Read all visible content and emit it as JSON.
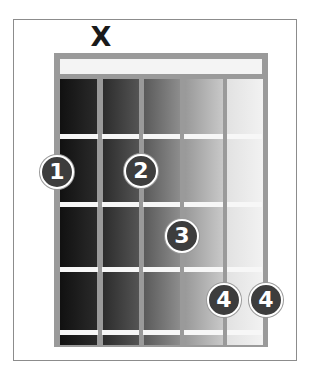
{
  "diagram": {
    "type": "guitar-chord-diagram",
    "strings": 6,
    "frets_shown": 4,
    "open_muted": [
      {
        "string": 2,
        "symbol": "X"
      }
    ],
    "fingers": [
      {
        "label": "1",
        "string": 1,
        "fret": 1
      },
      {
        "label": "2",
        "string": 3,
        "fret": 1
      },
      {
        "label": "3",
        "string": 4,
        "fret": 2
      },
      {
        "label": "4",
        "string": 5,
        "fret": 3
      },
      {
        "label": "4",
        "string": 6,
        "fret": 3
      }
    ],
    "colors": {
      "frame": "#8c8c8c",
      "board": "#9a9a9a",
      "nut": "#f4f4f4",
      "fret": "#f7f7f7",
      "finger_fill": "#3d3d3d",
      "finger_text": "#ffffff",
      "column_shades": [
        "#1a1a1a",
        "#3c3c3c",
        "#707070",
        "#a8a8a8",
        "#e8e8e8"
      ]
    }
  }
}
